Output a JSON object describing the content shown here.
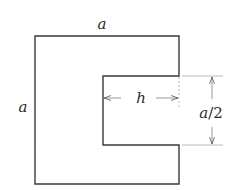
{
  "diagram": {
    "title": "",
    "shape": "C-shaped (U-shaped) region: square of side a with a rectangular slot cut from the right side",
    "labels": {
      "top_side": "a",
      "left_side": "a",
      "slot_depth": "h",
      "slot_width_var": "a",
      "slot_width_sep": "/",
      "slot_width_den": "2"
    },
    "colors": {
      "outline": "#3a3a3a",
      "dimension": "#6a6a6a",
      "text": "#2a2a2a",
      "background": "#ffffff"
    }
  }
}
